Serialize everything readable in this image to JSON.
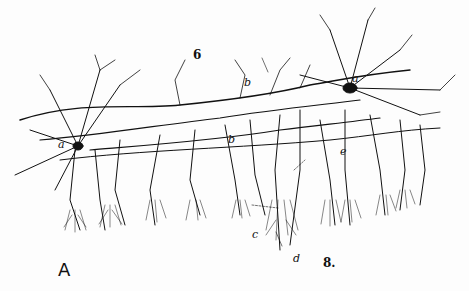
{
  "figure": {
    "panel_label": "A",
    "labels": {
      "six": "6",
      "eight": "8.",
      "a_left": "a",
      "a_right": "a",
      "b_top": "b",
      "b_mid": "b",
      "e": "e",
      "c": "c",
      "d": "d"
    },
    "colors": {
      "ink": "#111111",
      "paper": "#fdfdfd"
    }
  }
}
